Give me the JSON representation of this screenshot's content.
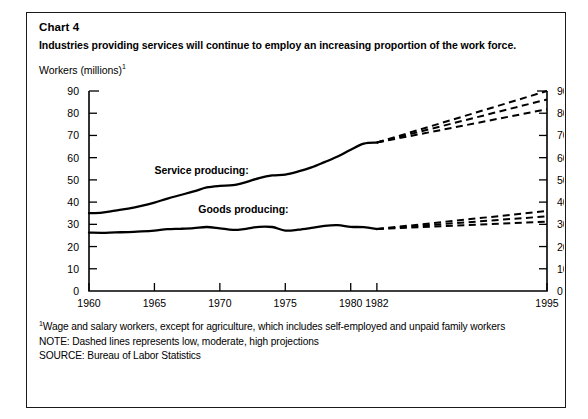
{
  "card": {
    "chart_number": "Chart 4",
    "headline": "Industries providing services will continue to employ an increasing proportion of the work force.",
    "y_axis_title": "Workers (millions)",
    "y_axis_title_footnote_marker": "1"
  },
  "footnotes": {
    "marker": "1",
    "line1": "Wage and salary workers, except for agriculture, which includes self-employed and unpaid family workers",
    "line2": "NOTE: Dashed lines represents low, moderate, high projections",
    "line3": "SOURCE: Bureau of Labor Statistics"
  },
  "chart_data": {
    "type": "line",
    "title": "Industries providing services will continue to employ an increasing proportion of the work force.",
    "xlabel": "",
    "ylabel": "Workers (millions)",
    "xlim": [
      1960,
      1995
    ],
    "ylim": [
      0,
      90
    ],
    "grid": false,
    "legend_position": "inline-annotation",
    "x_ticks": [
      1960,
      1965,
      1970,
      1975,
      1980,
      1982,
      1995
    ],
    "x_tick_labels": [
      "1960",
      "1965",
      "1970",
      "1975",
      "1980",
      "1982",
      "1995"
    ],
    "y_ticks": [
      0,
      10,
      20,
      30,
      40,
      50,
      60,
      70,
      80,
      90
    ],
    "y_tick_labels": [
      "0",
      "10",
      "20",
      "30",
      "40",
      "50",
      "60",
      "70",
      "80",
      "90"
    ],
    "y_axis_right_mirrored": true,
    "projection_start_year": 1982,
    "annotations": [
      {
        "text": "Service producing:",
        "x": 1968.6,
        "y": 52.5
      },
      {
        "text": "Goods producing:",
        "x": 1971.8,
        "y": 35.0
      }
    ],
    "series": [
      {
        "name": "Service producing",
        "style": "solid",
        "x": [
          1960,
          1961,
          1962,
          1963,
          1964,
          1965,
          1966,
          1967,
          1968,
          1969,
          1970,
          1971,
          1972,
          1973,
          1974,
          1975,
          1976,
          1977,
          1978,
          1979,
          1980,
          1981,
          1982
        ],
        "values": [
          35.0,
          35.3,
          36.2,
          37.1,
          38.3,
          39.8,
          41.6,
          43.2,
          44.8,
          46.6,
          47.3,
          47.6,
          49.0,
          50.8,
          52.0,
          52.4,
          53.8,
          55.6,
          58.0,
          60.5,
          63.6,
          66.3,
          66.8
        ]
      },
      {
        "name": "Goods producing",
        "style": "solid",
        "x": [
          1960,
          1961,
          1962,
          1963,
          1964,
          1965,
          1966,
          1967,
          1968,
          1969,
          1970,
          1971,
          1972,
          1973,
          1974,
          1975,
          1976,
          1977,
          1978,
          1979,
          1980,
          1981,
          1982
        ],
        "values": [
          26.3,
          26.2,
          26.4,
          26.5,
          26.8,
          27.2,
          27.8,
          28.0,
          28.3,
          28.8,
          28.2,
          27.5,
          28.0,
          28.9,
          28.8,
          27.2,
          27.6,
          28.4,
          29.3,
          29.6,
          28.9,
          28.7,
          27.9
        ]
      },
      {
        "name": "Service producing - high projection",
        "style": "dashed",
        "x": [
          1982,
          1995
        ],
        "values": [
          66.8,
          90.0
        ]
      },
      {
        "name": "Service producing - moderate projection",
        "style": "dashed",
        "x": [
          1982,
          1995
        ],
        "values": [
          66.8,
          86.2
        ]
      },
      {
        "name": "Service producing - low projection",
        "style": "dashed",
        "x": [
          1982,
          1995
        ],
        "values": [
          66.8,
          81.8
        ]
      },
      {
        "name": "Goods producing - high projection",
        "style": "dashed",
        "x": [
          1982,
          1995
        ],
        "values": [
          27.9,
          36.0
        ]
      },
      {
        "name": "Goods producing - moderate projection",
        "style": "dashed",
        "x": [
          1982,
          1995
        ],
        "values": [
          27.9,
          33.6
        ]
      },
      {
        "name": "Goods producing - low projection",
        "style": "dashed",
        "x": [
          1982,
          1995
        ],
        "values": [
          27.9,
          31.2
        ]
      }
    ]
  }
}
